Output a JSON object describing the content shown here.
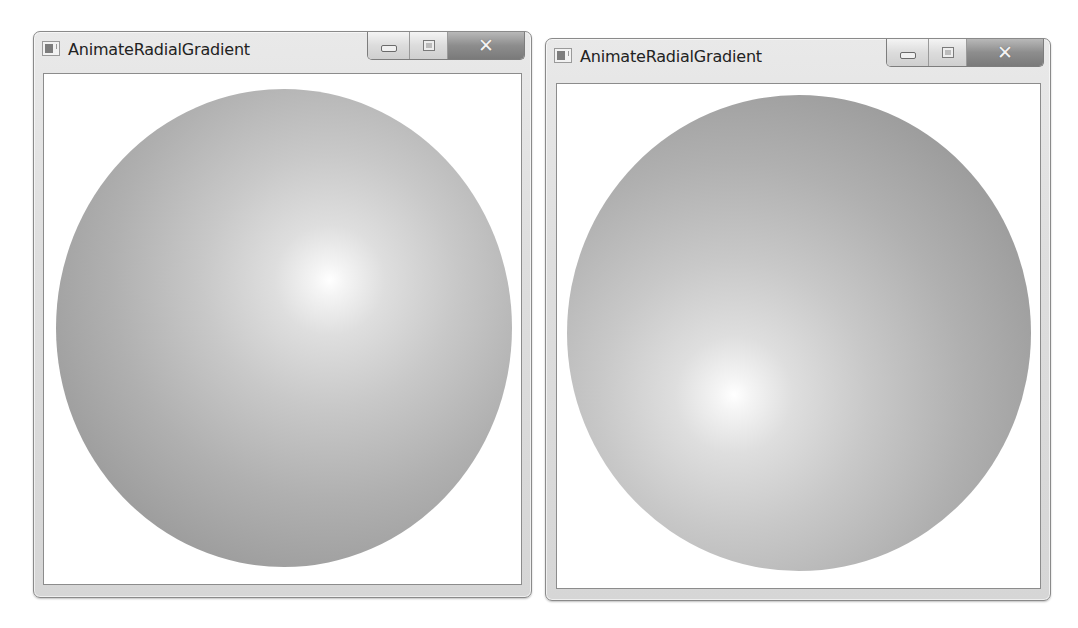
{
  "windows": [
    {
      "title": "AnimateRadialGradient",
      "icon": "app-window-icon",
      "caption_buttons": {
        "minimize": "minimize-icon",
        "maximize": "maximize-icon",
        "close": "close-icon",
        "close_glyph": "✕"
      },
      "content": {
        "shape": "ellipse",
        "gradient_origin_pct": [
          60,
          40
        ],
        "colors": {
          "center": "#ffffff",
          "edge": "#8e8e8e"
        }
      }
    },
    {
      "title": "AnimateRadialGradient",
      "icon": "app-window-icon",
      "caption_buttons": {
        "minimize": "minimize-icon",
        "maximize": "maximize-icon",
        "close": "close-icon",
        "close_glyph": "✕"
      },
      "content": {
        "shape": "ellipse",
        "gradient_origin_pct": [
          36,
          63
        ],
        "colors": {
          "center": "#ffffff",
          "edge": "#8e8e8e"
        }
      }
    }
  ]
}
